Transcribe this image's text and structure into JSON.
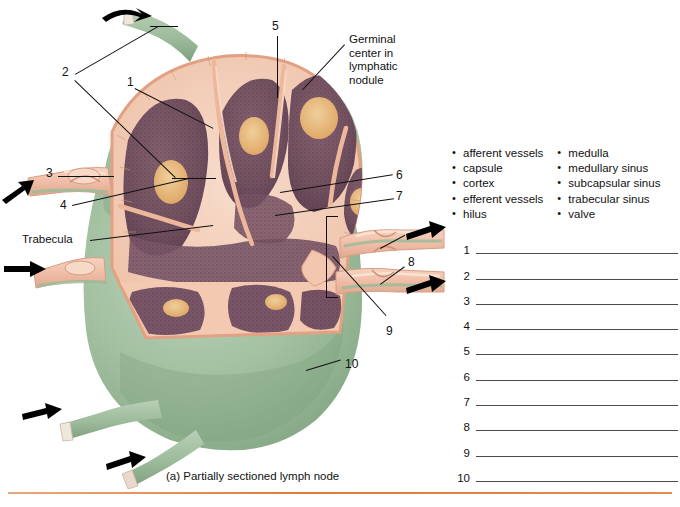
{
  "figure": {
    "caption": "(a)  Partially sectioned lymph node",
    "callouts": [
      {
        "id": "germinal-center",
        "text": "Germinal\ncenter in\nlymphatic\nnodule",
        "lines": [
          "Germinal",
          "center in",
          "lymphatic",
          "nodule"
        ]
      },
      {
        "id": "trabecula",
        "text": "Trabecula"
      }
    ],
    "number_labels": [
      "1",
      "2",
      "3",
      "4",
      "5",
      "6",
      "7",
      "8",
      "9",
      "10"
    ],
    "flow_arrows": {
      "afferent_count": 4,
      "efferent_count": 2,
      "afferent_direction": "into-node",
      "efferent_direction": "out-of-node"
    },
    "colors": {
      "capsule_green": "#9cbb9c",
      "capsule_green_dark": "#7da07c",
      "cortex_purple": "#7d5a6b",
      "cortex_purple_dark": "#6a4a5c",
      "medulla_pink": "#f0bca4",
      "sinus_pink": "#f6d5c2",
      "germinal_orange": "#e8b878",
      "vessel_pink": "#f2c0aa",
      "rule_orange": "#e07b39"
    }
  },
  "word_bank": {
    "column_1": [
      "afferent vessels",
      "capsule",
      "cortex",
      "efferent vessels",
      "hilus"
    ],
    "column_2": [
      "medulla",
      "medullary sinus",
      "subcapsular sinus",
      "trabecular sinus",
      "valve"
    ]
  },
  "answer_blanks": {
    "numbers": [
      "1",
      "2",
      "3",
      "4",
      "5",
      "6",
      "7",
      "8",
      "9",
      "10"
    ],
    "values": [
      "",
      "",
      "",
      "",
      "",
      "",
      "",
      "",
      "",
      ""
    ]
  }
}
